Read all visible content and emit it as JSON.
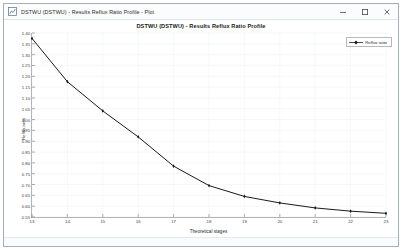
{
  "window": {
    "titlebar_text": "DSTWU (DSTWU) - Results Reflux Ratio Profile - Plot",
    "app_icon": "plot-window-icon",
    "controls": {
      "minimize": "─",
      "maximize": "□",
      "close": "✕"
    }
  },
  "chart_data": {
    "type": "line",
    "title": "DSTWU (DSTWU) - Results Reflux Ratio Profile",
    "xlabel": "Theoretical stages",
    "ylabel": "Reflux ratio",
    "xlim": [
      13,
      23
    ],
    "ylim": [
      0.55,
      1.4
    ],
    "xticks": [
      13,
      14,
      15,
      16,
      17,
      18,
      19,
      20,
      21,
      22,
      23
    ],
    "yticks": [
      0.55,
      0.6,
      0.65,
      0.7,
      0.75,
      0.8,
      0.85,
      0.9,
      0.95,
      1.0,
      1.05,
      1.1,
      1.15,
      1.2,
      1.25,
      1.3,
      1.35,
      1.4
    ],
    "ytick_labels": [
      "0.55",
      "0.60",
      "0.65",
      "0.70",
      "0.75",
      "0.80",
      "0.85",
      "0.90",
      "0.95",
      "1.00",
      "1.05",
      "1.10",
      "1.15",
      "1.20",
      "1.25",
      "1.30",
      "1.35",
      "1.40"
    ],
    "grid": true,
    "legend_position": "top-right",
    "series": [
      {
        "name": "Reflux ratio",
        "color": "#1a1a1a",
        "marker": "diamond",
        "x": [
          13,
          14,
          15,
          16,
          17,
          18,
          19,
          20,
          21,
          22,
          23
        ],
        "values": [
          1.375,
          1.175,
          1.04,
          0.92,
          0.785,
          0.695,
          0.645,
          0.615,
          0.592,
          0.577,
          0.567
        ]
      }
    ]
  },
  "legend": {
    "entries": [
      {
        "label": "Reflux ratio",
        "color": "#1a1a1a"
      }
    ]
  }
}
